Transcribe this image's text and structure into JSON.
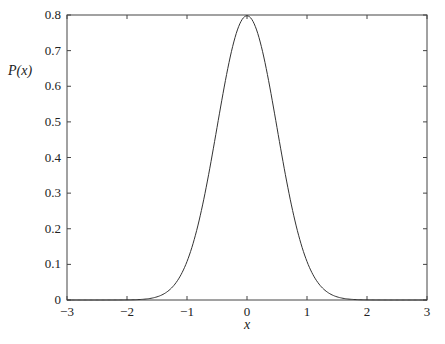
{
  "chart_data": {
    "type": "line",
    "title": "",
    "xlabel": "x",
    "ylabel": "P(x)",
    "xlim": [
      -3,
      3
    ],
    "ylim": [
      0,
      0.8
    ],
    "xticks": [
      -3,
      -2,
      -1,
      0,
      1,
      2,
      3
    ],
    "xtick_labels": [
      "−3",
      "−2",
      "−1",
      "0",
      "1",
      "2",
      "3"
    ],
    "yticks": [
      0,
      0.1,
      0.2,
      0.3,
      0.4,
      0.5,
      0.6,
      0.7,
      0.8
    ],
    "ytick_labels": [
      "0",
      "0.1",
      "0.2",
      "0.3",
      "0.4",
      "0.5",
      "0.6",
      "0.7",
      "0.8"
    ],
    "grid": false,
    "legend": null,
    "series": [
      {
        "name": "P(x)",
        "description": "Gaussian, mean 0, standard deviation 0.5",
        "mean": 0,
        "std": 0.5,
        "x": [
          -3,
          -2.5,
          -2,
          -1.75,
          -1.5,
          -1.25,
          -1,
          -0.75,
          -0.5,
          -0.25,
          0,
          0.25,
          0.5,
          0.75,
          1,
          1.25,
          1.5,
          1.75,
          2,
          2.5,
          3
        ],
        "y": [
          0.0,
          0.0,
          0.0003,
          0.0018,
          0.0089,
          0.035,
          0.108,
          0.259,
          0.4839,
          0.7041,
          0.7979,
          0.7041,
          0.4839,
          0.259,
          0.108,
          0.035,
          0.0089,
          0.0018,
          0.0003,
          0.0,
          0.0
        ],
        "color": "#333333"
      }
    ]
  }
}
